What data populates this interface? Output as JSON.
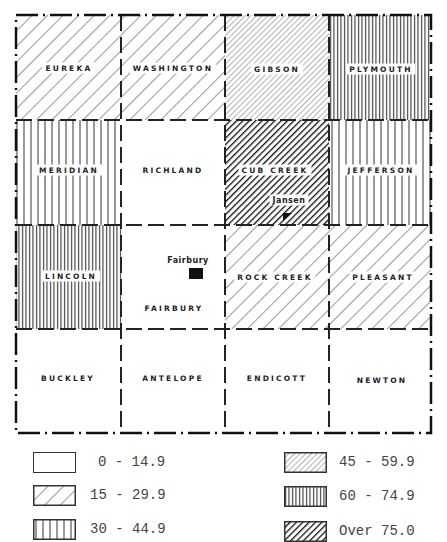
{
  "map": {
    "grid": {
      "cols": [
        16,
        121,
        225,
        329,
        431
      ],
      "rows": [
        15,
        120,
        225,
        329,
        433
      ]
    },
    "townships": [
      {
        "name": "EUREKA",
        "row": 0,
        "col": 0,
        "class": "15-29.9"
      },
      {
        "name": "WASHINGTON",
        "row": 0,
        "col": 1,
        "class": "15-29.9"
      },
      {
        "name": "GIBSON",
        "row": 0,
        "col": 2,
        "class": "45-59.9"
      },
      {
        "name": "PLYMOUTH",
        "row": 0,
        "col": 3,
        "class": "60-74.9"
      },
      {
        "name": "MERIDIAN",
        "row": 1,
        "col": 0,
        "class": "30-44.9"
      },
      {
        "name": "RICHLAND",
        "row": 1,
        "col": 1,
        "class": "0-14.9"
      },
      {
        "name": "CUB CREEK",
        "row": 1,
        "col": 2,
        "class": "Over 75.0"
      },
      {
        "name": "JEFFERSON",
        "row": 1,
        "col": 3,
        "class": "30-44.9"
      },
      {
        "name": "LINCOLN",
        "row": 2,
        "col": 0,
        "class": "60-74.9"
      },
      {
        "name": "FAIRBURY",
        "row": 2,
        "col": 1,
        "class": "0-14.9"
      },
      {
        "name": "ROCK CREEK",
        "row": 2,
        "col": 2,
        "class": "15-29.9"
      },
      {
        "name": "PLEASANT",
        "row": 2,
        "col": 3,
        "class": "15-29.9"
      },
      {
        "name": "BUCKLEY",
        "row": 3,
        "col": 0,
        "class": "0-14.9"
      },
      {
        "name": "ANTELOPE",
        "row": 3,
        "col": 1,
        "class": "0-14.9"
      },
      {
        "name": "ENDICOTT",
        "row": 3,
        "col": 2,
        "class": "0-14.9"
      },
      {
        "name": "NEWTON",
        "row": 3,
        "col": 3,
        "class": "0-14.9"
      }
    ],
    "towns": [
      {
        "name": "Jansen"
      },
      {
        "name": "Fairbury"
      }
    ]
  },
  "legend": {
    "items": [
      {
        "label": "0 - 14.9",
        "pattern": "empty"
      },
      {
        "label": "15 - 29.9",
        "pattern": "wide-diagonal"
      },
      {
        "label": "30 - 44.9",
        "pattern": "wide-vertical"
      },
      {
        "label": "45 - 59.9",
        "pattern": "fine-diagonal"
      },
      {
        "label": "60 - 74.9",
        "pattern": "dense-vertical"
      },
      {
        "label": "Over 75.0",
        "pattern": "heavy-diagonal"
      }
    ]
  }
}
